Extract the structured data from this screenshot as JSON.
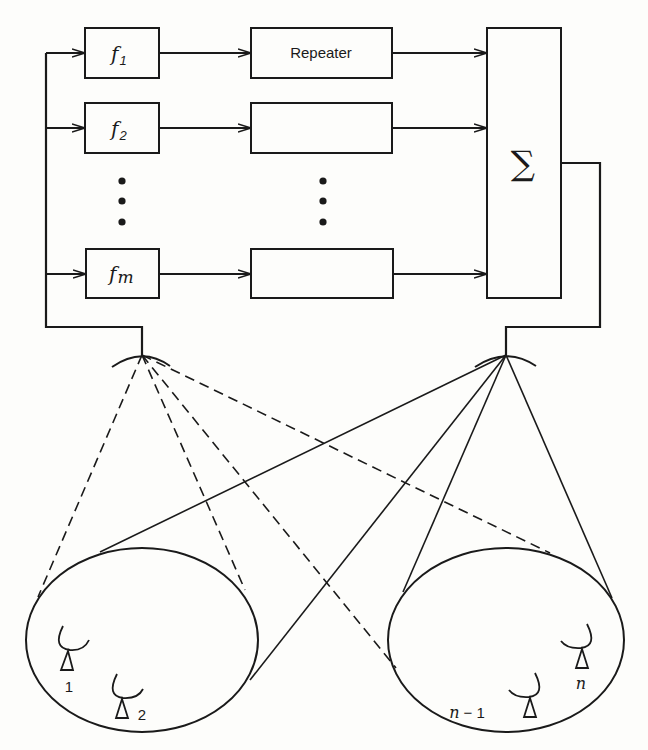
{
  "diagram": {
    "channels": [
      {
        "filter_label": "f",
        "filter_sub": "1",
        "repeater_label": "Repeater"
      },
      {
        "filter_label": "f",
        "filter_sub": "2",
        "repeater_label": ""
      },
      {
        "filter_label": "f",
        "filter_sub": "m",
        "repeater_label": ""
      }
    ],
    "ellipsis": "vertical-dots",
    "combiner": {
      "label": "∑"
    },
    "uplink_antenna": {
      "name": "receive-dish"
    },
    "downlink_antenna": {
      "name": "transmit-dish"
    },
    "coverage_areas": [
      {
        "name": "left-coverage",
        "terminals": [
          {
            "label": "1"
          },
          {
            "label": "2"
          }
        ]
      },
      {
        "name": "right-coverage",
        "terminals": [
          {
            "label_ital": "n",
            "label_rest": " − 1"
          },
          {
            "label_ital": "n",
            "label_rest": ""
          }
        ]
      }
    ],
    "beams": {
      "uplink_style": "dashed",
      "downlink_style": "solid"
    },
    "colors": {
      "ink": "#1a1a1a",
      "paper": "#fdfdfb"
    }
  }
}
